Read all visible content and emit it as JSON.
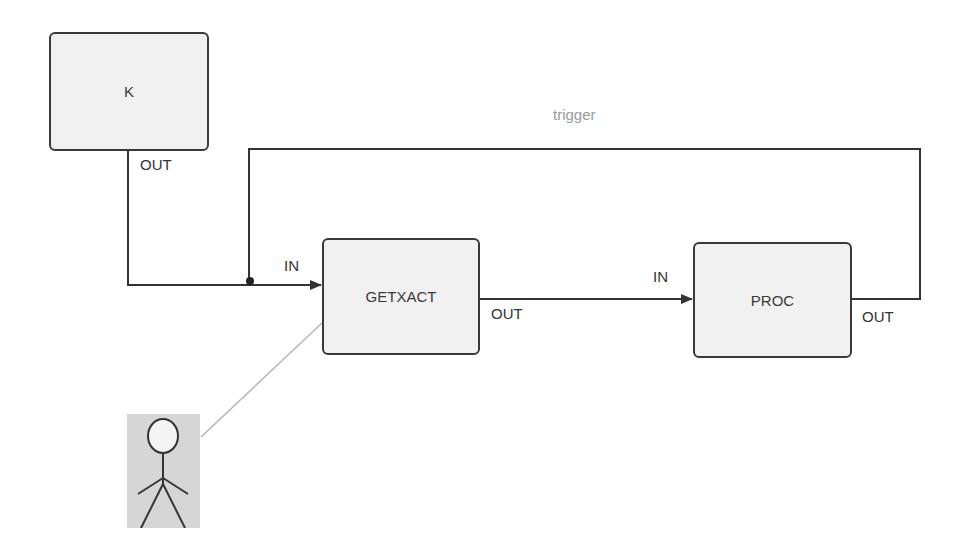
{
  "diagram": {
    "nodes": [
      {
        "id": "K",
        "label": "K",
        "out_port": "OUT"
      },
      {
        "id": "GETXACT",
        "label": "GETXACT",
        "in_port": "IN",
        "out_port": "OUT"
      },
      {
        "id": "PROC",
        "label": "PROC",
        "in_port": "IN",
        "out_port": "OUT"
      }
    ],
    "edges": [
      {
        "from": "K.OUT",
        "to": "GETXACT.IN"
      },
      {
        "from": "GETXACT.OUT",
        "to": "PROC.IN"
      },
      {
        "from": "PROC.OUT",
        "to": "GETXACT.IN",
        "label": "trigger"
      }
    ],
    "actor": {
      "icon": "stick-figure-icon",
      "associated_with": "GETXACT"
    },
    "colors": {
      "node_fill": "#f1f1f1",
      "node_border": "#3a3a3a",
      "edge": "#333333",
      "edge_label": "#9a9a9a",
      "actor_bg": "#d6d6d6",
      "association_line": "#b5b5b5"
    }
  }
}
